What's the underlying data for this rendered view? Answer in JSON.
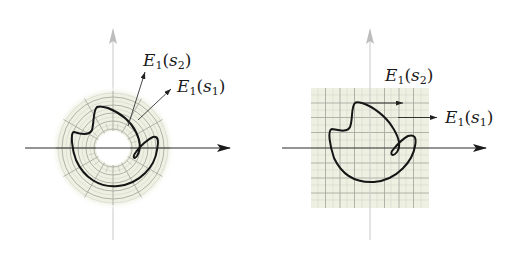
{
  "figure": {
    "panels": [
      {
        "id": "polar",
        "grid_type": "polar annulus",
        "labels": [
          {
            "var": "E",
            "sub": "1",
            "arg": "s",
            "arg_sub": "2",
            "text": "E1(s2)"
          },
          {
            "var": "E",
            "sub": "1",
            "arg": "s",
            "arg_sub": "1",
            "text": "E1(s1)"
          }
        ]
      },
      {
        "id": "cartesian",
        "grid_type": "square grid",
        "labels": [
          {
            "var": "E",
            "sub": "1",
            "arg": "s",
            "arg_sub": "2",
            "text": "E1(s2)"
          },
          {
            "var": "E",
            "sub": "1",
            "arg": "s",
            "arg_sub": "1",
            "text": "E1(s1)"
          }
        ]
      }
    ],
    "colors": {
      "grid_fill": "#eef0e2",
      "grid_line": "#a9aba4",
      "curve": "#151515",
      "axis": "#2a2a2a",
      "vertical_axis": "#b8b8b8"
    }
  }
}
